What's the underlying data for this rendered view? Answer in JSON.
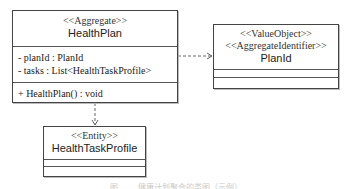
{
  "classes": {
    "health_plan": {
      "stereotype": "<<Aggregate>>",
      "name": "HealthPlan",
      "attributes": [
        "- planId : PlanId",
        "- tasks : List<HealthTaskProfile>"
      ],
      "operations": [
        "+ HealthPlan() : void"
      ]
    },
    "plan_id": {
      "stereotypes": [
        "<<ValueObject>>",
        "<<AggregateIdentifier>>"
      ],
      "name": "PlanId"
    },
    "health_task_profile": {
      "stereotype": "<<Entity>>",
      "name": "HealthTaskProfile"
    }
  },
  "relations": [
    {
      "from": "HealthPlan",
      "to": "PlanId",
      "type": "dependency"
    },
    {
      "from": "HealthPlan",
      "to": "HealthTaskProfile",
      "type": "dependency"
    }
  ],
  "caption": "图 ...... 健康计划聚合的类图（示例）"
}
